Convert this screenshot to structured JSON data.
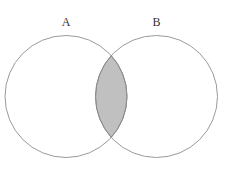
{
  "diagram": {
    "type": "venn",
    "sets": [
      {
        "label": "A",
        "cx": 66,
        "cy": 96.5,
        "r": 61
      },
      {
        "label": "B",
        "cx": 156.5,
        "cy": 96.5,
        "r": 61
      }
    ],
    "shaded_region": "A ∩ B",
    "colors": {
      "background": "#ffffff",
      "stroke": "#9a9a9a",
      "intersection_fill": "#c0c0c0",
      "label": "#333333"
    }
  }
}
